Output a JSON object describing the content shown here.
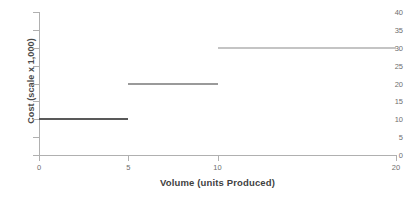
{
  "chart_data": {
    "type": "line",
    "subtype": "step",
    "title": "",
    "xlabel": "Volume (units Produced)",
    "ylabel": "Cost (scale x 1,000)",
    "xlim": [
      0,
      20
    ],
    "ylim": [
      0,
      40
    ],
    "xticks": [
      0,
      5,
      10,
      20
    ],
    "xtick_labels": [
      "0",
      "5",
      "10",
      "20"
    ],
    "yticks": [
      0,
      5,
      10,
      15,
      20,
      25,
      30,
      35,
      40
    ],
    "ytick_labels": [
      "0",
      "5",
      "10",
      "15",
      "20",
      "25",
      "30",
      "35",
      "40"
    ],
    "grid": false,
    "legend": false,
    "series": [
      {
        "name": "step-1",
        "x_start": 0,
        "x_end": 5,
        "value": 10,
        "color": "#595959"
      },
      {
        "name": "step-2",
        "x_start": 5,
        "x_end": 10,
        "value": 20,
        "color": "#9a9a9a"
      },
      {
        "name": "step-3",
        "x_start": 10,
        "x_end": 20,
        "value": 30,
        "color": "#c4c4c4"
      }
    ],
    "step_points": [
      {
        "x": 0,
        "y": 10
      },
      {
        "x": 5,
        "y": 10
      },
      {
        "x": 5,
        "y": 20
      },
      {
        "x": 10,
        "y": 20
      },
      {
        "x": 10,
        "y": 30
      },
      {
        "x": 20,
        "y": 30
      }
    ],
    "axis_color": "#b0b0b0",
    "tick_label_color": "#6e6e6e",
    "axis_title_color": "#3f3f3f"
  }
}
